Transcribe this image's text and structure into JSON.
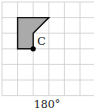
{
  "diagram": {
    "grid": {
      "cols": 6,
      "rows": 6,
      "cell": 15.6,
      "origin_x": 2,
      "origin_y": 2,
      "line_color": "#cccccc"
    },
    "shape": {
      "points": [
        [
          1,
          1
        ],
        [
          3,
          1
        ],
        [
          2,
          2
        ],
        [
          2,
          3
        ],
        [
          1,
          3
        ]
      ],
      "fill": "#aaaaaa",
      "stroke": "#111111"
    },
    "point": {
      "label": "C",
      "grid_x": 2,
      "grid_y": 3
    }
  },
  "caption": "180°"
}
